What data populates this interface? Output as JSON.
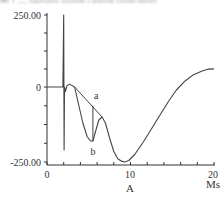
{
  "caption": {
    "text": "图 1 — partially visible caption (truncated)"
  },
  "chart_data": {
    "type": "line",
    "title": "",
    "xlabel": "A",
    "x_unit": "Ms",
    "ylabel": "",
    "xlim": [
      0,
      20
    ],
    "ylim": [
      -250,
      250
    ],
    "x_tick_labels": [
      "0",
      "10",
      "20"
    ],
    "x_ticks": [
      0,
      2,
      4,
      6,
      8,
      10,
      12,
      14,
      16,
      18,
      20
    ],
    "y_tick_labels": [
      "250.00",
      "0",
      "-250.00"
    ],
    "y_ticks": [
      -250,
      -187.5,
      -125,
      -62.5,
      0,
      62.5,
      125,
      187.5,
      250
    ],
    "grid": false,
    "legend": null,
    "annotations": [
      {
        "label": "a",
        "x": 5.9,
        "y": -45,
        "note": "straight chord line from bump to local peak"
      },
      {
        "label": "b",
        "x": 5.5,
        "y": -205,
        "note": "local minimum of curve"
      }
    ],
    "series": [
      {
        "name": "main-trace",
        "x": [
          0,
          1.9,
          2.0,
          2.05,
          2.1,
          2.2,
          2.4,
          2.7,
          3.0,
          3.3,
          3.8,
          4.3,
          4.8,
          5.2,
          5.5,
          5.8,
          6.2,
          6.6,
          7.0,
          7.5,
          8.0,
          8.5,
          9.0,
          9.3,
          9.8,
          10.5,
          11.5,
          12.5,
          13.5,
          14.5,
          15.5,
          16.5,
          17.5,
          18.5,
          19.3,
          20
        ],
        "y": [
          0,
          0,
          250,
          -210,
          0,
          -15,
          5,
          10,
          5,
          0,
          -60,
          -120,
          -165,
          -180,
          -180,
          -150,
          -110,
          -100,
          -120,
          -170,
          -215,
          -240,
          -248,
          -250,
          -245,
          -225,
          -185,
          -140,
          -95,
          -50,
          -10,
          20,
          42,
          55,
          62,
          63
        ]
      },
      {
        "name": "chord-a",
        "x": [
          3.3,
          6.6
        ],
        "y": [
          0,
          -100
        ]
      },
      {
        "name": "drop-line-b",
        "x": [
          5.5,
          5.5
        ],
        "y": [
          -180,
          -62
        ]
      }
    ]
  }
}
